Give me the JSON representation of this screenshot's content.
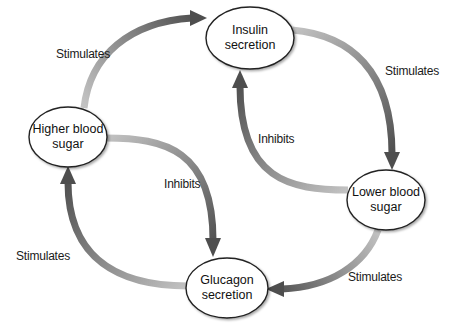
{
  "diagram": {
    "type": "feedback-cycle",
    "nodes": [
      {
        "id": "insulin",
        "line1": "Insulin",
        "line2": "secretion"
      },
      {
        "id": "higher",
        "line1": "Higher blood",
        "line2": "sugar"
      },
      {
        "id": "lower",
        "line1": "Lower blood",
        "line2": "sugar"
      },
      {
        "id": "glucagon",
        "line1": "Glucagon",
        "line2": "secretion"
      }
    ],
    "edges": [
      {
        "from": "higher",
        "to": "insulin",
        "label": "Stimulates"
      },
      {
        "from": "insulin",
        "to": "lower",
        "label": "Stimulates"
      },
      {
        "from": "lower",
        "to": "insulin",
        "label": "Inhibits"
      },
      {
        "from": "higher",
        "to": "glucagon",
        "label": "Inhibits"
      },
      {
        "from": "lower",
        "to": "glucagon",
        "label": "Stimulates"
      },
      {
        "from": "glucagon",
        "to": "higher",
        "label": "Stimulates"
      }
    ],
    "colors": {
      "arrow_light": "#b5b5b5",
      "arrow_dark": "#555555",
      "node_fill": "#ffffff",
      "node_stroke": "#222222"
    }
  }
}
